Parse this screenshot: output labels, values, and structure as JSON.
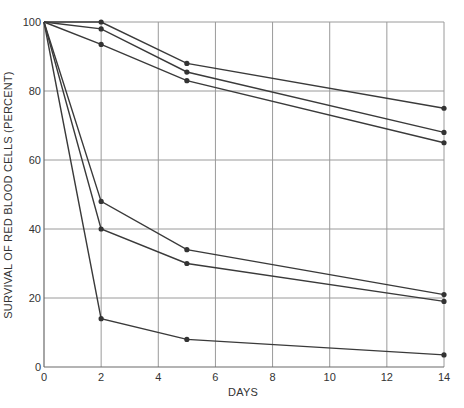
{
  "chart_data": {
    "type": "line",
    "title": "",
    "xlabel": "DAYS",
    "ylabel": "SURVIVAL OF RED BLOOD CELLS (PERCENT)",
    "xlim": [
      0,
      14
    ],
    "ylim": [
      0,
      100
    ],
    "xticks": [
      0,
      2,
      4,
      6,
      8,
      10,
      12,
      14
    ],
    "yticks": [
      0,
      20,
      40,
      60,
      80,
      100
    ],
    "grid": true,
    "legend": null,
    "series": [
      {
        "name": "series-1",
        "x": [
          0,
          2,
          5,
          14
        ],
        "y": [
          100,
          100,
          88,
          75
        ]
      },
      {
        "name": "series-2",
        "x": [
          0,
          2,
          5,
          14
        ],
        "y": [
          100,
          98,
          85.5,
          68
        ]
      },
      {
        "name": "series-3",
        "x": [
          0,
          2,
          5,
          14
        ],
        "y": [
          100,
          93.5,
          83,
          65
        ]
      },
      {
        "name": "series-4",
        "x": [
          0,
          2,
          5,
          14
        ],
        "y": [
          100,
          48,
          34,
          21
        ]
      },
      {
        "name": "series-5",
        "x": [
          0,
          2,
          5,
          14
        ],
        "y": [
          100,
          40,
          30,
          19
        ]
      },
      {
        "name": "series-6",
        "x": [
          0,
          2,
          5,
          14
        ],
        "y": [
          100,
          14,
          8,
          3.5
        ]
      }
    ]
  },
  "colors": {
    "line": "#3a3a3a",
    "grid": "#9a9a9a",
    "text": "#333333"
  }
}
